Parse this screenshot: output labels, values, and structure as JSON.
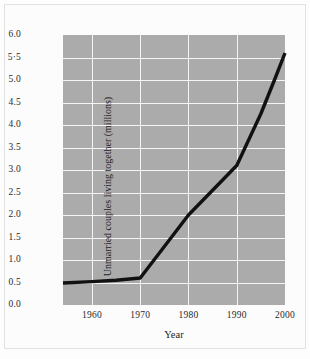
{
  "chart_data": {
    "type": "line",
    "title": "",
    "xlabel": "Year",
    "ylabel": "Unmarried couples living together (millions)",
    "xlim": [
      1954,
      2000
    ],
    "ylim": [
      0.0,
      6.0
    ],
    "grid": true,
    "legend_position": "none",
    "xticks": [
      1960,
      1970,
      1980,
      1990,
      2000
    ],
    "xtick_labels": [
      "1960",
      "1970",
      "1980",
      "1990",
      "2000"
    ],
    "yticks": [
      0.0,
      0.5,
      1.0,
      1.5,
      2.0,
      2.5,
      3.0,
      3.5,
      4.0,
      4.5,
      5.0,
      5.5,
      6.0
    ],
    "ytick_labels": [
      "0.0",
      "0.5",
      "1.0",
      "1.5",
      "2.0",
      "2.5",
      "3.0",
      "3.5",
      "4.0",
      "4.5",
      "5.0",
      "5·5",
      "6.0"
    ],
    "series": [
      {
        "name": "Unmarried couples living together",
        "color": "#111111",
        "x": [
          1954,
          1960,
          1965,
          1970,
          1975,
          1980,
          1985,
          1990,
          1995,
          1998,
          2000
        ],
        "values": [
          0.49,
          0.52,
          0.55,
          0.6,
          1.3,
          2.0,
          2.55,
          3.1,
          4.25,
          5.05,
          5.6
        ]
      }
    ],
    "panel_color": "#ababab",
    "gridline_color": "#f4f4f4"
  }
}
